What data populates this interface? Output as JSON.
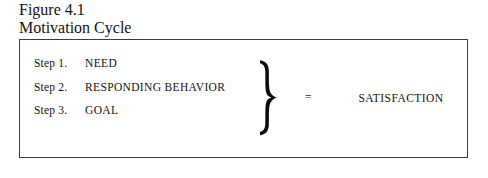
{
  "figure": {
    "number": "Figure 4.1",
    "title": "Motivation Cycle"
  },
  "diagram": {
    "steps": [
      {
        "label": "Step 1.",
        "value": "NEED"
      },
      {
        "label": "Step 2.",
        "value": "RESPONDING BEHAVIOR"
      },
      {
        "label": "Step 3.",
        "value": "GOAL"
      }
    ],
    "brace": "right-curly-brace",
    "equals": "=",
    "result": "SATISFACTION"
  },
  "style": {
    "ink": "#111111",
    "border": "#3a3a3a",
    "background": "#ffffff"
  }
}
